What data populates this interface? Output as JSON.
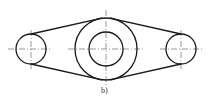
{
  "figure": {
    "label": "b)",
    "colors": {
      "outline": "#1a1a1a",
      "centerline": "#555555",
      "background": "#ffffff"
    }
  },
  "geometry": {
    "left_circle": {
      "cx": 31,
      "cy": 49,
      "r": 15
    },
    "center_outer": {
      "cx": 106,
      "cy": 49,
      "r": 31
    },
    "center_inner": {
      "cx": 106,
      "cy": 49,
      "r": 17
    },
    "right_circle": {
      "cx": 181,
      "cy": 49,
      "r": 15
    }
  }
}
